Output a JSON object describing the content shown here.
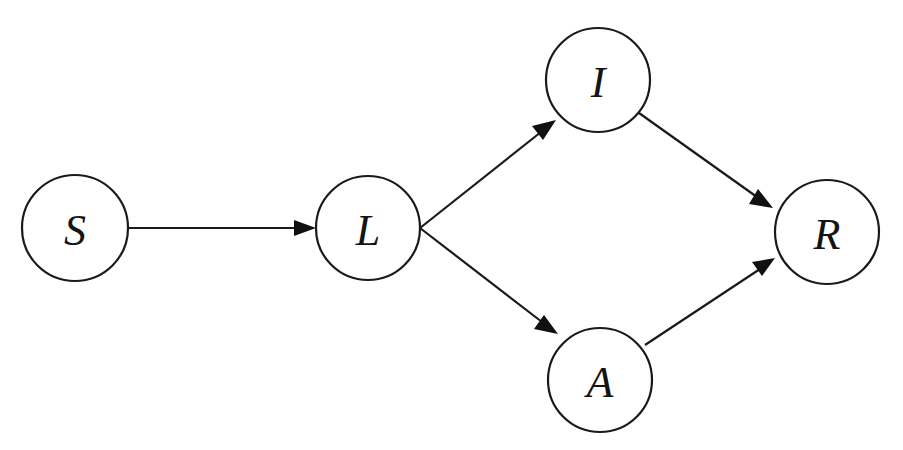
{
  "diagram": {
    "type": "directed-graph",
    "background_color": "#ffffff",
    "stroke_color": "#1a1a1a",
    "label_color": "#141414",
    "canvas": {
      "width": 903,
      "height": 450
    },
    "nodes": [
      {
        "id": "S",
        "label": "S",
        "cx": 75,
        "cy": 228,
        "r": 53
      },
      {
        "id": "L",
        "label": "L",
        "cx": 368,
        "cy": 228,
        "r": 52
      },
      {
        "id": "I",
        "label": "I",
        "cx": 598,
        "cy": 80,
        "r": 52
      },
      {
        "id": "A",
        "label": "A",
        "cx": 600,
        "cy": 380,
        "r": 52
      },
      {
        "id": "R",
        "label": "R",
        "cx": 827,
        "cy": 232,
        "r": 52
      }
    ],
    "edges": [
      {
        "id": "S-L",
        "from": "S",
        "to": "L",
        "label": "",
        "x1": 128,
        "y1": 228,
        "x2": 316,
        "y2": 228,
        "arrow": true
      },
      {
        "id": "L-I",
        "from": "L",
        "to": "I",
        "label": "",
        "x1": 420,
        "y1": 228,
        "x2": 556,
        "y2": 120,
        "arrow": true
      },
      {
        "id": "L-A",
        "from": "L",
        "to": "A",
        "label": "",
        "x1": 420,
        "y1": 228,
        "x2": 558,
        "y2": 334,
        "arrow": true
      },
      {
        "id": "I-R",
        "from": "I",
        "to": "R",
        "label": "",
        "x1": 639,
        "y1": 113,
        "x2": 773,
        "y2": 208,
        "arrow": true
      },
      {
        "id": "A-R",
        "from": "A",
        "to": "R",
        "label": "",
        "x1": 645,
        "y1": 345,
        "x2": 775,
        "y2": 258,
        "arrow": true
      }
    ]
  }
}
